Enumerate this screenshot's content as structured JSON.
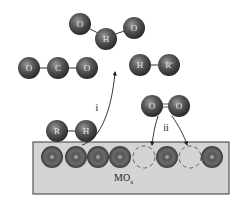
{
  "diagram": {
    "colors": {
      "atom": "#4a4a4a",
      "surface": "#d4d4d4",
      "surface_border": "#555555",
      "bond": "#333333",
      "arrow": "#222222"
    },
    "products": {
      "water": {
        "atoms": [
          "O",
          "H",
          "O"
        ],
        "label": "H2O"
      },
      "co2": {
        "atoms": [
          "O",
          "C",
          "O"
        ],
        "label": "CO2"
      },
      "hr": {
        "atoms": [
          "H",
          "R'"
        ],
        "label": "HR'"
      }
    },
    "reactants": {
      "rh": {
        "atoms": [
          "R",
          "H"
        ]
      },
      "o2": {
        "atoms": [
          "O",
          "O"
        ]
      }
    },
    "steps": {
      "i": "i",
      "ii": "ii"
    },
    "surface": {
      "label_main": "MO",
      "label_sub": "x",
      "sites": [
        "O",
        "O",
        "O",
        "O",
        "vacancy",
        "O",
        "vacancy",
        "O"
      ]
    }
  }
}
